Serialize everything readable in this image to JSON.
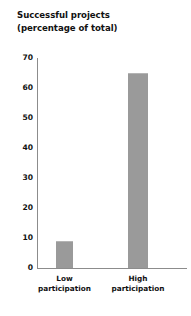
{
  "chart_data": {
    "type": "bar",
    "title": "Successful projects (percentage of total)",
    "title_lines": [
      "Successful projects",
      "(percentage of total)"
    ],
    "categories": [
      "Low participation",
      "High participation"
    ],
    "category_lines": [
      [
        "Low",
        "participation"
      ],
      [
        "High",
        "participation"
      ]
    ],
    "values": [
      9,
      65
    ],
    "xlabel": "",
    "ylabel": "",
    "ylim": [
      0,
      70
    ],
    "ytick_values": [
      0,
      10,
      20,
      30,
      40,
      50,
      60,
      70
    ],
    "ytick_labels": [
      "0",
      "10",
      "20",
      "30",
      "40",
      "50",
      "60",
      "70"
    ],
    "grid": false,
    "legend": false,
    "bar_color": "#9a9a9a",
    "axis_color": "#8c8c8c",
    "text_color": "#111111",
    "background": "#ffffff"
  }
}
